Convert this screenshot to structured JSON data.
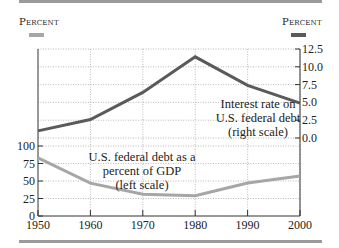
{
  "colors": {
    "frame_bar": "#9a9a9a",
    "debt_series": "#a6a6a6",
    "interest_series": "#5a5a5a",
    "grid": "#aaaaaa",
    "axis": "#333333"
  },
  "left_unit_label": "Percent",
  "right_unit_label": "Percent",
  "chart_data": {
    "type": "line",
    "title": "",
    "xlabel": "",
    "x": [
      1950,
      1960,
      1970,
      1980,
      1990,
      2000
    ],
    "x_tick_labels": [
      "1950",
      "1960",
      "1970",
      "1980",
      "1990",
      "2000"
    ],
    "left_axis": {
      "label": "Percent",
      "ticks": [
        "0",
        "25",
        "50",
        "75",
        "100"
      ],
      "range": [
        0,
        100
      ]
    },
    "right_axis": {
      "label": "Percent",
      "ticks": [
        "0.0",
        "2.5",
        "5.0",
        "7.5",
        "10.0",
        "12.5"
      ],
      "range": [
        0,
        12.5
      ]
    },
    "series": [
      {
        "name": "U.S. federal debt as a percent of GDP (left scale)",
        "axis": "left",
        "values": [
          83,
          47,
          31,
          29,
          47,
          57
        ]
      },
      {
        "name": "Interest rate on U.S. federal debt (right scale)",
        "axis": "right",
        "values": [
          1.0,
          2.6,
          6.4,
          11.4,
          7.4,
          4.9
        ]
      }
    ],
    "annotations": [
      {
        "lines": [
          "Interest rate on",
          "U.S. federal debt",
          "(right scale)"
        ]
      },
      {
        "lines": [
          "U.S. federal debt as a",
          "percent of GDP",
          "(left scale)"
        ]
      }
    ],
    "grid": true,
    "legend_position": "none (inline annotations)"
  }
}
